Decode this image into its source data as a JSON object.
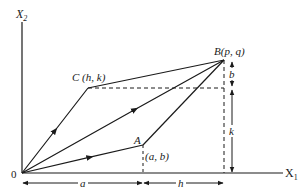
{
  "diagram": {
    "axes": {
      "x_label": "X",
      "x_sub": "1",
      "y_label": "X",
      "y_sub": "2",
      "origin_label": "0"
    },
    "points": {
      "C": {
        "name": "C",
        "coords": "(h, k)"
      },
      "B": {
        "name": "B",
        "coords": "(p, q)"
      },
      "A": {
        "name": "A",
        "coords": "(a, b)"
      }
    },
    "dimensions": {
      "a": "a",
      "h": "h",
      "b": "b",
      "k": "k"
    },
    "colors": {
      "ink": "#1a1a1a",
      "background": "#ffffff"
    }
  }
}
